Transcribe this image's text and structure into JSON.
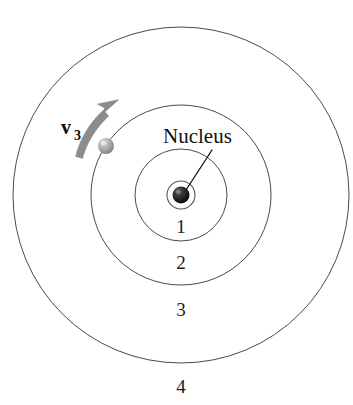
{
  "figure": {
    "background_color": "#ffffff",
    "width": 353,
    "height": 405
  },
  "nucleus": {
    "label": "Nucleus",
    "color": "#1a1a1a",
    "highlight_color": "#6e6e6e",
    "center": {
      "x": 181,
      "y": 195
    },
    "radius": 8.5,
    "leader_line": {
      "x1": 187,
      "y1": 189,
      "x2": 212,
      "y2": 150
    }
  },
  "orbits": [
    {
      "label": "1",
      "radius": 14,
      "label_x": 181,
      "label_y": 233,
      "stroke": "#555555"
    },
    {
      "label": "2",
      "radius": 46,
      "label_x": 181,
      "label_y": 269,
      "stroke": "#4a4a4a"
    },
    {
      "label": "3",
      "radius": 90,
      "label_x": 181,
      "label_y": 315,
      "stroke": "#4a4a4a"
    },
    {
      "label": "4",
      "radius": 168,
      "label_x": 181,
      "label_y": 392,
      "stroke": "#4a4a4a"
    }
  ],
  "electron": {
    "name": "electron",
    "orbit_index": 3,
    "center": {
      "x": 106,
      "y": 146
    },
    "radius": 8,
    "fill_color": "#a8a8a8",
    "highlight_color": "#d8d8d8"
  },
  "velocity_vector": {
    "symbol": "v",
    "subscript": "3",
    "full_label": "v3",
    "color": "#8c8c8c",
    "label_x": 62,
    "label_y": 133,
    "sub_x": 78,
    "sub_y": 138,
    "arrow_tail": {
      "x": 76,
      "y": 155
    },
    "arrow_tip": {
      "x": 118,
      "y": 100
    }
  }
}
